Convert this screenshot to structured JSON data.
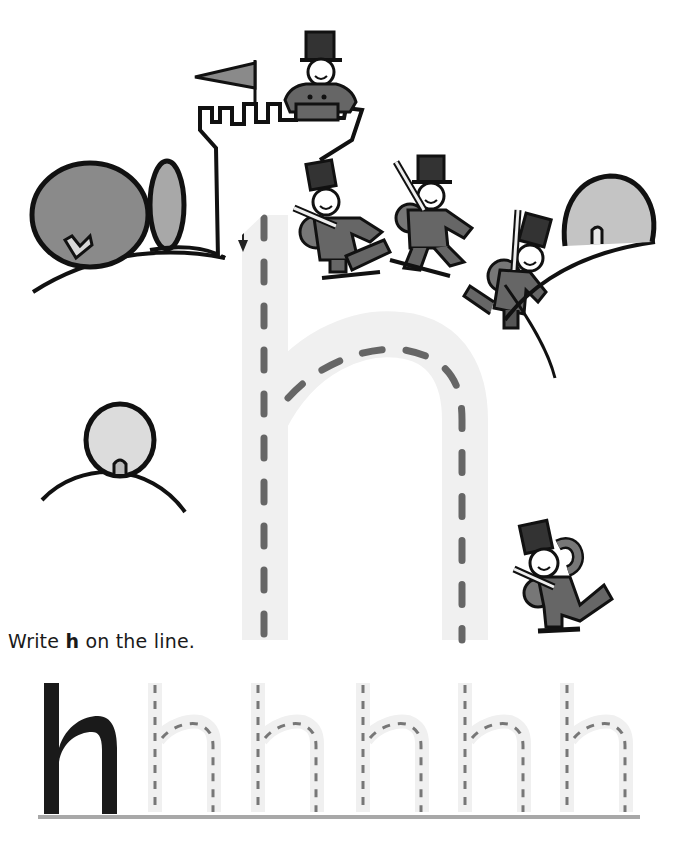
{
  "worksheet": {
    "top_text_cut": "",
    "letter": "h",
    "instruction": {
      "prefix": "Write ",
      "letter": "h",
      "suffix": " on the line."
    },
    "trace_start_arrow": "down-arrow",
    "practice_row": {
      "model_letter": "h",
      "trace_count": 5
    },
    "colors": {
      "trace_band": "#f0f0f0",
      "trace_dash": "#666666",
      "baseline": "#a8a8a8",
      "ink": "#1a1a1a",
      "uniform_dark": "#555555",
      "bush_dark": "#8a8a8a",
      "bush_light": "#c4c4c4",
      "bush_pale": "#dcdcdc"
    }
  }
}
